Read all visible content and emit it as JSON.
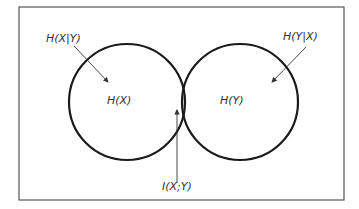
{
  "diagram": {
    "type": "venn",
    "labels": {
      "h_x_given_y": "H(X|Y)",
      "h_y_given_x": "H(Y|X)",
      "h_x": "H(X)",
      "h_y": "H(Y)",
      "mutual_info": "I(X;Y)"
    },
    "colors": {
      "stroke": "#1a1a1a",
      "frame": "#555555",
      "text": "#333333",
      "background": "#ffffff"
    }
  }
}
